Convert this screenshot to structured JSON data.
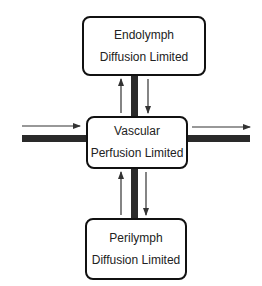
{
  "diagram": {
    "nodes": [
      {
        "id": "endolymph",
        "title": "Endolymph",
        "subtitle": "Diffusion Limited"
      },
      {
        "id": "vascular",
        "title": "Vascular",
        "subtitle": "Perfusion Limited"
      },
      {
        "id": "perilymph",
        "title": "Perilymph",
        "subtitle": "Diffusion Limited"
      }
    ],
    "edges": [
      {
        "from": "external-in",
        "to": "vascular",
        "direction": "left-to-right"
      },
      {
        "from": "vascular",
        "to": "external-out",
        "direction": "left-to-right"
      },
      {
        "from": "vascular",
        "to": "endolymph",
        "direction": "up"
      },
      {
        "from": "endolymph",
        "to": "vascular",
        "direction": "down"
      },
      {
        "from": "perilymph",
        "to": "vascular",
        "direction": "up"
      },
      {
        "from": "vascular",
        "to": "perilymph",
        "direction": "down"
      }
    ],
    "colors": {
      "stroke": "#111111",
      "bar": "#2a2a2a",
      "arrow": "#444444",
      "background": "#ffffff"
    }
  }
}
